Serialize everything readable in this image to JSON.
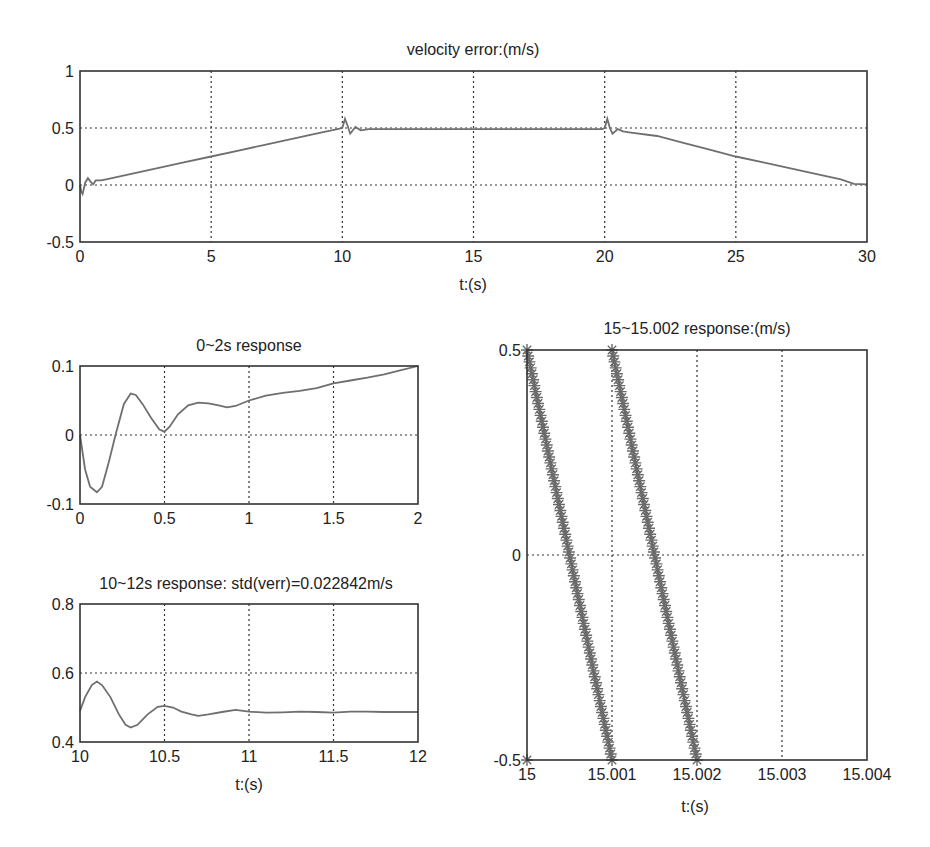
{
  "chart_data": [
    {
      "id": "velocity-error",
      "type": "line",
      "title": "velocity error:(m/s)",
      "xlabel": "t:(s)",
      "ylabel": "",
      "xlim": [
        0,
        30
      ],
      "ylim": [
        -0.5,
        1
      ],
      "xticks": [
        0,
        5,
        10,
        15,
        20,
        25,
        30
      ],
      "xtick_labels": [
        "0",
        "5",
        "10",
        "15",
        "20",
        "25",
        "30"
      ],
      "yticks": [
        -0.5,
        0,
        0.5,
        1
      ],
      "ytick_labels": [
        "-0.5",
        "0",
        "0.5",
        "1"
      ],
      "grid": true,
      "series": [
        {
          "name": "velocity error",
          "x": [
            0,
            0.05,
            0.1,
            0.2,
            0.3,
            0.4,
            0.5,
            0.6,
            0.8,
            1,
            2,
            3,
            4,
            5,
            6,
            7,
            8,
            9,
            9.9,
            10,
            10.1,
            10.2,
            10.3,
            10.5,
            10.7,
            11,
            12,
            14,
            16,
            18,
            19.9,
            20,
            20.1,
            20.2,
            20.3,
            20.5,
            20.7,
            21,
            22,
            23,
            24,
            25,
            26,
            27,
            28,
            29,
            29.5,
            30
          ],
          "y": [
            0,
            -0.06,
            -0.08,
            0.02,
            0.06,
            0.03,
            0.005,
            0.04,
            0.04,
            0.05,
            0.1,
            0.15,
            0.2,
            0.25,
            0.3,
            0.35,
            0.4,
            0.45,
            0.495,
            0.5,
            0.58,
            0.52,
            0.45,
            0.51,
            0.48,
            0.49,
            0.49,
            0.49,
            0.49,
            0.49,
            0.49,
            0.5,
            0.58,
            0.5,
            0.45,
            0.49,
            0.47,
            0.46,
            0.43,
            0.37,
            0.31,
            0.25,
            0.2,
            0.15,
            0.1,
            0.05,
            0.01,
            0.005
          ]
        }
      ]
    },
    {
      "id": "response-0-2s",
      "type": "line",
      "title": "0~2s response",
      "xlabel": "",
      "ylabel": "",
      "xlim": [
        0,
        2
      ],
      "ylim": [
        -0.1,
        0.1
      ],
      "xticks": [
        0,
        0.5,
        1,
        1.5,
        2
      ],
      "xtick_labels": [
        "0",
        "0.5",
        "1",
        "1.5",
        "2"
      ],
      "yticks": [
        -0.1,
        0,
        0.1
      ],
      "ytick_labels": [
        "-0.1",
        "0",
        "0.1"
      ],
      "grid": true,
      "series": [
        {
          "name": "velocity error",
          "x": [
            0,
            0.03,
            0.06,
            0.1,
            0.13,
            0.17,
            0.21,
            0.26,
            0.3,
            0.33,
            0.37,
            0.42,
            0.47,
            0.5,
            0.53,
            0.58,
            0.64,
            0.7,
            0.76,
            0.82,
            0.87,
            0.92,
            1.0,
            1.1,
            1.2,
            1.3,
            1.4,
            1.5,
            1.6,
            1.7,
            1.8,
            1.9,
            2.0
          ],
          "y": [
            0,
            -0.05,
            -0.075,
            -0.083,
            -0.075,
            -0.04,
            0.0,
            0.045,
            0.06,
            0.058,
            0.045,
            0.025,
            0.008,
            0.005,
            0.012,
            0.03,
            0.043,
            0.047,
            0.046,
            0.043,
            0.04,
            0.042,
            0.05,
            0.057,
            0.061,
            0.064,
            0.068,
            0.075,
            0.079,
            0.083,
            0.088,
            0.094,
            0.1
          ]
        }
      ]
    },
    {
      "id": "response-10-12s",
      "type": "line",
      "title": "10~12s response: std(verr)=0.022842m/s",
      "xlabel": "t:(s)",
      "ylabel": "",
      "xlim": [
        10,
        12
      ],
      "ylim": [
        0.4,
        0.8
      ],
      "xticks": [
        10,
        10.5,
        11,
        11.5,
        12
      ],
      "xtick_labels": [
        "10",
        "10.5",
        "11",
        "11.5",
        "12"
      ],
      "yticks": [
        0.4,
        0.6,
        0.8
      ],
      "ytick_labels": [
        "0.4",
        "0.6",
        "0.8"
      ],
      "grid": true,
      "series": [
        {
          "name": "velocity error",
          "x": [
            10,
            10.03,
            10.07,
            10.1,
            10.13,
            10.18,
            10.23,
            10.27,
            10.3,
            10.34,
            10.4,
            10.46,
            10.5,
            10.55,
            10.6,
            10.66,
            10.7,
            10.76,
            10.84,
            10.92,
            11.0,
            11.1,
            11.2,
            11.3,
            11.4,
            11.5,
            11.6,
            11.7,
            11.8,
            11.9,
            12.0
          ],
          "y": [
            0.49,
            0.53,
            0.565,
            0.575,
            0.565,
            0.53,
            0.48,
            0.45,
            0.442,
            0.45,
            0.48,
            0.502,
            0.505,
            0.5,
            0.488,
            0.48,
            0.476,
            0.48,
            0.487,
            0.493,
            0.488,
            0.485,
            0.486,
            0.488,
            0.487,
            0.485,
            0.488,
            0.488,
            0.487,
            0.487,
            0.487
          ]
        }
      ]
    },
    {
      "id": "response-15-15002",
      "type": "scatter",
      "title": "15~15.002 response:(m/s)",
      "xlabel": "t:(s)",
      "ylabel": "",
      "xlim": [
        15,
        15.004
      ],
      "ylim": [
        -0.5,
        0.5
      ],
      "xticks": [
        15,
        15.001,
        15.002,
        15.003,
        15.004
      ],
      "xtick_labels": [
        "15",
        "15.001",
        "15.002",
        "15.003",
        "15.004"
      ],
      "yticks": [
        -0.5,
        0,
        0.5
      ],
      "ytick_labels": [
        "-0.5",
        "0",
        "0.5"
      ],
      "grid": true,
      "marker": "*",
      "series": [
        {
          "name": "ramp 1",
          "x": [
            15.0,
            15.001
          ],
          "y": [
            0.5,
            -0.5
          ]
        },
        {
          "name": "ramp 2",
          "x": [
            15.001,
            15.002
          ],
          "y": [
            0.5,
            -0.5
          ]
        },
        {
          "name": "start point",
          "x": [
            15.0
          ],
          "y": [
            -0.5
          ]
        }
      ]
    }
  ]
}
